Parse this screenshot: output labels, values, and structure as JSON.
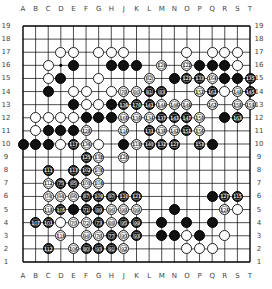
{
  "board": {
    "size": 19,
    "columns": [
      "A",
      "B",
      "C",
      "D",
      "E",
      "F",
      "G",
      "H",
      "J",
      "K",
      "L",
      "M",
      "N",
      "O",
      "P",
      "Q",
      "R",
      "S",
      "T"
    ],
    "rows": [
      19,
      18,
      17,
      16,
      15,
      14,
      13,
      12,
      11,
      10,
      9,
      8,
      7,
      6,
      5,
      4,
      3,
      2,
      1
    ],
    "colors": {
      "background": "#ffffff",
      "line": "#000000",
      "black": "#111111",
      "white": "#ffffff"
    }
  },
  "stones": [
    {
      "c": "D",
      "r": 17,
      "color": "w"
    },
    {
      "c": "E",
      "r": 17,
      "color": "w"
    },
    {
      "c": "G",
      "r": 17,
      "color": "w"
    },
    {
      "c": "H",
      "r": 17,
      "color": "w"
    },
    {
      "c": "J",
      "r": 17,
      "color": "w"
    },
    {
      "c": "O",
      "r": 17,
      "color": "w"
    },
    {
      "c": "Q",
      "r": 17,
      "color": "w"
    },
    {
      "c": "R",
      "r": 17,
      "color": "w"
    },
    {
      "c": "S",
      "r": 17,
      "color": "w"
    },
    {
      "c": "C",
      "r": 16,
      "color": "w"
    },
    {
      "c": "E",
      "r": 16,
      "color": "b"
    },
    {
      "c": "H",
      "r": 16,
      "color": "b"
    },
    {
      "c": "J",
      "r": 16,
      "color": "b"
    },
    {
      "c": "K",
      "r": 16,
      "color": "b"
    },
    {
      "c": "M",
      "r": 16,
      "color": "w",
      "n": "129"
    },
    {
      "c": "O",
      "r": 16,
      "color": "w",
      "n": "122"
    },
    {
      "c": "P",
      "r": 16,
      "color": "b"
    },
    {
      "c": "Q",
      "r": 16,
      "color": "b"
    },
    {
      "c": "R",
      "r": 16,
      "color": "b"
    },
    {
      "c": "S",
      "r": 16,
      "color": "w"
    },
    {
      "c": "C",
      "r": 15,
      "color": "w"
    },
    {
      "c": "D",
      "r": 15,
      "color": "b"
    },
    {
      "c": "G",
      "r": 15,
      "color": "w"
    },
    {
      "c": "L",
      "r": 15,
      "color": "w",
      "n": "82"
    },
    {
      "c": "N",
      "r": 15,
      "color": "b"
    },
    {
      "c": "O",
      "r": 15,
      "color": "b",
      "n": "123"
    },
    {
      "c": "P",
      "r": 15,
      "color": "b",
      "n": "133"
    },
    {
      "c": "Q",
      "r": 15,
      "color": "w",
      "n": "164"
    },
    {
      "c": "R",
      "r": 15,
      "color": "b"
    },
    {
      "c": "S",
      "r": 15,
      "color": "b"
    },
    {
      "c": "T",
      "r": 15,
      "color": "b",
      "n": "135"
    },
    {
      "c": "C",
      "r": 14,
      "color": "b"
    },
    {
      "c": "E",
      "r": 14,
      "color": "w"
    },
    {
      "c": "F",
      "r": 14,
      "color": "w"
    },
    {
      "c": "H",
      "r": 14,
      "color": "w"
    },
    {
      "c": "J",
      "r": 14,
      "color": "w",
      "n": "78"
    },
    {
      "c": "K",
      "r": 14,
      "color": "w",
      "n": "80"
    },
    {
      "c": "L",
      "r": 14,
      "color": "b",
      "n": "81"
    },
    {
      "c": "M",
      "r": 14,
      "color": "b",
      "n": "83"
    },
    {
      "c": "P",
      "r": 14,
      "color": "w",
      "n": "152"
    },
    {
      "c": "Q",
      "r": 14,
      "color": "b",
      "n": "161"
    },
    {
      "c": "R",
      "r": 14,
      "color": "w"
    },
    {
      "c": "S",
      "r": 14,
      "color": "w",
      "n": "148"
    },
    {
      "c": "T",
      "r": 14,
      "color": "b",
      "n": "145"
    },
    {
      "c": "E",
      "r": 13,
      "color": "b"
    },
    {
      "c": "F",
      "r": 13,
      "color": "w"
    },
    {
      "c": "G",
      "r": 13,
      "color": "w"
    },
    {
      "c": "H",
      "r": 13,
      "color": "b"
    },
    {
      "c": "J",
      "r": 13,
      "color": "b",
      "n": "139"
    },
    {
      "c": "K",
      "r": 13,
      "color": "b",
      "n": "170"
    },
    {
      "c": "L",
      "r": 13,
      "color": "b",
      "n": "141"
    },
    {
      "c": "M",
      "r": 13,
      "color": "w",
      "n": "144"
    },
    {
      "c": "N",
      "r": 13,
      "color": "w",
      "n": "146"
    },
    {
      "c": "O",
      "r": 13,
      "color": "w",
      "n": "149"
    },
    {
      "c": "Q",
      "r": 13,
      "color": "w",
      "n": "162"
    },
    {
      "c": "S",
      "r": 13,
      "color": "w",
      "n": "158"
    },
    {
      "c": "T",
      "r": 13,
      "color": "w",
      "n": "159"
    },
    {
      "c": "B",
      "r": 12,
      "color": "w"
    },
    {
      "c": "C",
      "r": 12,
      "color": "w"
    },
    {
      "c": "D",
      "r": 12,
      "color": "w"
    },
    {
      "c": "E",
      "r": 12,
      "color": "w"
    },
    {
      "c": "F",
      "r": 12,
      "color": "b"
    },
    {
      "c": "G",
      "r": 12,
      "color": "b"
    },
    {
      "c": "H",
      "r": 12,
      "color": "b"
    },
    {
      "c": "J",
      "r": 12,
      "color": "w",
      "n": "160"
    },
    {
      "c": "K",
      "r": 12,
      "color": "w",
      "n": "130"
    },
    {
      "c": "L",
      "r": 12,
      "color": "w",
      "n": "134"
    },
    {
      "c": "M",
      "r": 12,
      "color": "b",
      "n": "137"
    },
    {
      "c": "N",
      "r": 12,
      "color": "b",
      "n": "143"
    },
    {
      "c": "O",
      "r": 12,
      "color": "b",
      "n": "147"
    },
    {
      "c": "P",
      "r": 12,
      "color": "w",
      "n": "150"
    },
    {
      "c": "R",
      "r": 12,
      "color": "b"
    },
    {
      "c": "S",
      "r": 12,
      "color": "b",
      "n": "163"
    },
    {
      "c": "B",
      "r": 11,
      "color": "w"
    },
    {
      "c": "C",
      "r": 11,
      "color": "b"
    },
    {
      "c": "D",
      "r": 11,
      "color": "b"
    },
    {
      "c": "E",
      "r": 11,
      "color": "b"
    },
    {
      "c": "F",
      "r": 11,
      "color": "w",
      "n": "128"
    },
    {
      "c": "J",
      "r": 11,
      "color": "w",
      "n": "116"
    },
    {
      "c": "L",
      "r": 11,
      "color": "b",
      "n": "131"
    },
    {
      "c": "M",
      "r": 11,
      "color": "w",
      "n": "138"
    },
    {
      "c": "N",
      "r": 11,
      "color": "w",
      "n": "142"
    },
    {
      "c": "O",
      "r": 11,
      "color": "b",
      "n": "151"
    },
    {
      "c": "P",
      "r": 11,
      "color": "w",
      "n": "156"
    },
    {
      "c": "A",
      "r": 10,
      "color": "b"
    },
    {
      "c": "B",
      "r": 10,
      "color": "b"
    },
    {
      "c": "C",
      "r": 10,
      "color": "b"
    },
    {
      "c": "D",
      "r": 10,
      "color": "w"
    },
    {
      "c": "E",
      "r": 10,
      "color": "b",
      "n": "117"
    },
    {
      "c": "F",
      "r": 10,
      "color": "w",
      "n": "136"
    },
    {
      "c": "G",
      "r": 10,
      "color": "w"
    },
    {
      "c": "J",
      "r": 10,
      "color": "b"
    },
    {
      "c": "K",
      "r": 10,
      "color": "w",
      "n": "118"
    },
    {
      "c": "L",
      "r": 10,
      "color": "b",
      "n": "140"
    },
    {
      "c": "M",
      "r": 10,
      "color": "b",
      "n": "132"
    },
    {
      "c": "N",
      "r": 10,
      "color": "b",
      "n": "127"
    },
    {
      "c": "P",
      "r": 10,
      "color": "b",
      "n": "153"
    },
    {
      "c": "Q",
      "r": 10,
      "color": "b"
    },
    {
      "c": "F",
      "r": 9,
      "color": "b",
      "n": "125"
    },
    {
      "c": "G",
      "r": 9,
      "color": "w",
      "n": "138"
    },
    {
      "c": "J",
      "r": 9,
      "color": "w",
      "n": "120"
    },
    {
      "c": "C",
      "r": 8,
      "color": "b",
      "n": "111"
    },
    {
      "c": "E",
      "r": 8,
      "color": "b",
      "n": "113"
    },
    {
      "c": "F",
      "r": 8,
      "color": "b",
      "n": "102"
    },
    {
      "c": "G",
      "r": 8,
      "color": "w",
      "n": "108"
    },
    {
      "c": "C",
      "r": 7,
      "color": "w",
      "n": "112"
    },
    {
      "c": "D",
      "r": 7,
      "color": "b",
      "n": "75"
    },
    {
      "c": "E",
      "r": 7,
      "color": "b",
      "n": "85"
    },
    {
      "c": "F",
      "r": 7,
      "color": "w",
      "n": "100"
    },
    {
      "c": "G",
      "r": 7,
      "color": "w",
      "n": "104"
    },
    {
      "c": "C",
      "r": 6,
      "color": "w",
      "n": "74"
    },
    {
      "c": "D",
      "r": 6,
      "color": "w",
      "n": "84"
    },
    {
      "c": "E",
      "r": 6,
      "color": "w",
      "n": "86"
    },
    {
      "c": "F",
      "r": 6,
      "color": "b",
      "n": "87"
    },
    {
      "c": "G",
      "r": 6,
      "color": "b",
      "n": "109"
    },
    {
      "c": "H",
      "r": 6,
      "color": "b",
      "n": "97"
    },
    {
      "c": "J",
      "r": 6,
      "color": "b",
      "n": "110"
    },
    {
      "c": "K",
      "r": 6,
      "color": "b",
      "n": "121"
    },
    {
      "c": "Q",
      "r": 6,
      "color": "b"
    },
    {
      "c": "R",
      "r": 6,
      "color": "b",
      "n": "127"
    },
    {
      "c": "S",
      "r": 6,
      "color": "b",
      "n": "115"
    },
    {
      "c": "C",
      "r": 5,
      "color": "w",
      "n": "118"
    },
    {
      "c": "D",
      "r": 5,
      "color": "b",
      "n": "105"
    },
    {
      "c": "E",
      "r": 5,
      "color": "b"
    },
    {
      "c": "F",
      "r": 5,
      "color": "b",
      "n": "71"
    },
    {
      "c": "G",
      "r": 5,
      "color": "b",
      "n": "89"
    },
    {
      "c": "H",
      "r": 5,
      "color": "w",
      "n": "96"
    },
    {
      "c": "J",
      "r": 5,
      "color": "w",
      "n": "98"
    },
    {
      "c": "K",
      "r": 5,
      "color": "w",
      "n": "99"
    },
    {
      "c": "N",
      "r": 5,
      "color": "b"
    },
    {
      "c": "R",
      "r": 5,
      "color": "w",
      "n": "126"
    },
    {
      "c": "S",
      "r": 5,
      "color": "w"
    },
    {
      "c": "B",
      "r": 4,
      "color": "b",
      "n": "107"
    },
    {
      "c": "C",
      "r": 4,
      "color": "b",
      "n": "101"
    },
    {
      "c": "D",
      "r": 4,
      "color": "w"
    },
    {
      "c": "E",
      "r": 4,
      "color": "w",
      "n": "70"
    },
    {
      "c": "F",
      "r": 4,
      "color": "w",
      "n": "72"
    },
    {
      "c": "G",
      "r": 4,
      "color": "b",
      "n": "73"
    },
    {
      "c": "H",
      "r": 4,
      "color": "w",
      "n": "88"
    },
    {
      "c": "J",
      "r": 4,
      "color": "b",
      "n": "95"
    },
    {
      "c": "K",
      "r": 4,
      "color": "b",
      "n": "99"
    },
    {
      "c": "M",
      "r": 4,
      "color": "b"
    },
    {
      "c": "O",
      "r": 4,
      "color": "b"
    },
    {
      "c": "Q",
      "r": 4,
      "color": "b"
    },
    {
      "c": "D",
      "r": 3,
      "color": "w",
      "n": "119"
    },
    {
      "c": "F",
      "r": 3,
      "color": "w",
      "n": "94"
    },
    {
      "c": "G",
      "r": 3,
      "color": "w",
      "n": "76"
    },
    {
      "c": "H",
      "r": 3,
      "color": "b",
      "n": "77"
    },
    {
      "c": "J",
      "r": 3,
      "color": "w",
      "n": "90"
    },
    {
      "c": "K",
      "r": 3,
      "color": "b",
      "n": "93"
    },
    {
      "c": "M",
      "r": 3,
      "color": "b"
    },
    {
      "c": "N",
      "r": 3,
      "color": "b"
    },
    {
      "c": "O",
      "r": 3,
      "color": "w"
    },
    {
      "c": "P",
      "r": 3,
      "color": "b"
    },
    {
      "c": "R",
      "r": 3,
      "color": "w"
    },
    {
      "c": "C",
      "r": 2,
      "color": "b",
      "n": "112"
    },
    {
      "c": "E",
      "r": 2,
      "color": "w",
      "n": "106"
    },
    {
      "c": "F",
      "r": 2,
      "color": "b",
      "n": "80"
    },
    {
      "c": "G",
      "r": 2,
      "color": "b",
      "n": "93"
    },
    {
      "c": "H",
      "r": 2,
      "color": "b",
      "n": "91"
    },
    {
      "c": "J",
      "r": 2,
      "color": "w",
      "n": "92"
    },
    {
      "c": "O",
      "r": 2,
      "color": "w"
    },
    {
      "c": "P",
      "r": 2,
      "color": "w"
    },
    {
      "c": "Q",
      "r": 2,
      "color": "w"
    }
  ]
}
